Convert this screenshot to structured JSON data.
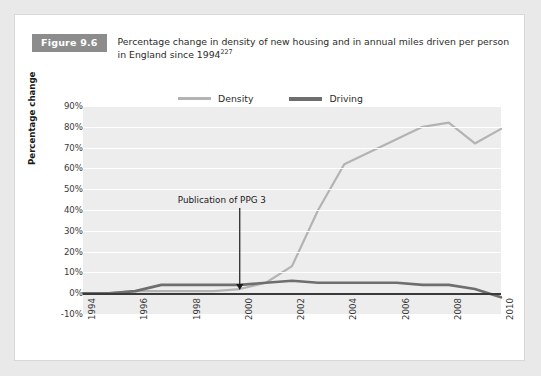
{
  "figure": {
    "badge": "Figure 9.6",
    "caption": "Percentage change in density of new housing and in annual miles driven per person in England since 1994",
    "caption_superscript": "227"
  },
  "legend": {
    "position": "top-center",
    "items": [
      {
        "label": "Density",
        "color": "#b3b3b3"
      },
      {
        "label": "Driving",
        "color": "#6e6e6e"
      }
    ]
  },
  "annotation": {
    "text": "Publication of PPG 3",
    "at_year": 2000
  },
  "colors": {
    "badge_background": "#8c8c8c",
    "plot_background": "#ededed",
    "gridline": "#ffffff",
    "zero_line": "#3a3a3a",
    "density": "#b3b3b3",
    "driving": "#6e6e6e",
    "page_background": "#e9e9e9",
    "card_background": "#ffffff"
  },
  "chart_data": {
    "type": "line",
    "title": "Percentage change in density of new housing and in annual miles driven per person in England since 1994",
    "xlabel": "",
    "ylabel": "Percentage change",
    "xlim": [
      1994,
      2010
    ],
    "ylim": [
      -10,
      90
    ],
    "grid": true,
    "legend_position": "top-center",
    "ytick_labels": [
      "90%",
      "80%",
      "70%",
      "60%",
      "50%",
      "40%",
      "30%",
      "20%",
      "10%",
      "0%",
      "-10%"
    ],
    "ytick_values": [
      90,
      80,
      70,
      60,
      50,
      40,
      30,
      20,
      10,
      0,
      -10
    ],
    "xtick_labels": [
      "1994",
      "1996",
      "1998",
      "2000",
      "2002",
      "2004",
      "2006",
      "2008",
      "2010"
    ],
    "xtick_values": [
      1994,
      1996,
      1998,
      2000,
      2002,
      2004,
      2006,
      2008,
      2010
    ],
    "x": [
      1994,
      1995,
      1996,
      1997,
      1998,
      1999,
      2000,
      2001,
      2002,
      2003,
      2004,
      2005,
      2006,
      2007,
      2008,
      2009,
      2010
    ],
    "series": [
      {
        "name": "Density",
        "color": "#b3b3b3",
        "values": [
          0,
          0,
          1,
          1,
          1,
          1,
          2,
          5,
          13,
          40,
          62,
          68,
          74,
          80,
          82,
          72,
          79
        ]
      },
      {
        "name": "Driving",
        "color": "#6e6e6e",
        "values": [
          0,
          0,
          1,
          4,
          4,
          4,
          4,
          5,
          6,
          5,
          5,
          5,
          5,
          4,
          4,
          2,
          -2
        ]
      }
    ],
    "annotations": [
      {
        "text": "Publication of PPG 3",
        "x": 2000,
        "y": 0,
        "arrow": "down"
      }
    ]
  }
}
